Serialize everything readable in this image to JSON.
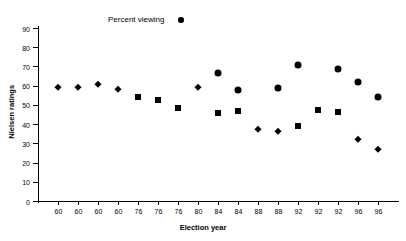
{
  "chart_data": {
    "type": "scatter",
    "title": "",
    "xlabel": "Election year",
    "ylabel": "Nielsen ratings",
    "ylim": [
      0,
      90
    ],
    "y_ticks": [
      0,
      10,
      20,
      30,
      40,
      50,
      60,
      70,
      80,
      90
    ],
    "grid": false,
    "legend": {
      "position": "top-center",
      "entries": [
        {
          "label": "Percent viewing",
          "marker": "circle",
          "color": "#000000"
        }
      ]
    },
    "x_tick_labels": [
      "60",
      "60",
      "60",
      "60",
      "76",
      "76",
      "76",
      "80",
      "84",
      "84",
      "88",
      "88",
      "92",
      "92",
      "92",
      "96",
      "96"
    ],
    "x_positions": [
      1,
      2,
      3,
      4,
      5,
      6,
      7,
      8,
      9,
      10,
      11,
      12,
      13,
      14,
      15,
      16,
      17
    ],
    "points": [
      {
        "x": 1,
        "year": "60",
        "y": 59.5,
        "marker": "diamond"
      },
      {
        "x": 2,
        "year": "60",
        "y": 59.1,
        "marker": "diamond"
      },
      {
        "x": 3,
        "year": "60",
        "y": 61.0,
        "marker": "diamond"
      },
      {
        "x": 4,
        "year": "60",
        "y": 58.1,
        "marker": "diamond"
      },
      {
        "x": 5,
        "year": "76",
        "y": 53.9,
        "marker": "square"
      },
      {
        "x": 6,
        "year": "76",
        "y": 52.8,
        "marker": "square"
      },
      {
        "x": 7,
        "year": "76",
        "y": 48.3,
        "marker": "square"
      },
      {
        "x": 8,
        "year": "80",
        "y": 59.3,
        "marker": "diamond"
      },
      {
        "x": 9,
        "year": "84",
        "y": 66.6,
        "marker": "circle"
      },
      {
        "x": 9,
        "year": "84",
        "y": 46.0,
        "marker": "square"
      },
      {
        "x": 10,
        "year": "84",
        "y": 57.6,
        "marker": "circle"
      },
      {
        "x": 10,
        "year": "84",
        "y": 46.7,
        "marker": "square"
      },
      {
        "x": 11,
        "year": "88",
        "y": 37.5,
        "marker": "diamond"
      },
      {
        "x": 12,
        "year": "88",
        "y": 58.8,
        "marker": "circle"
      },
      {
        "x": 12,
        "year": "88",
        "y": 36.6,
        "marker": "diamond"
      },
      {
        "x": 13,
        "year": "92",
        "y": 70.7,
        "marker": "circle"
      },
      {
        "x": 13,
        "year": "92",
        "y": 39.1,
        "marker": "square"
      },
      {
        "x": 14,
        "year": "92",
        "y": 47.1,
        "marker": "square"
      },
      {
        "x": 15,
        "year": "92",
        "y": 68.8,
        "marker": "circle"
      },
      {
        "x": 15,
        "year": "92",
        "y": 46.1,
        "marker": "square"
      },
      {
        "x": 16,
        "year": "96",
        "y": 61.7,
        "marker": "circle"
      },
      {
        "x": 16,
        "year": "96",
        "y": 32.4,
        "marker": "diamond"
      },
      {
        "x": 17,
        "year": "96",
        "y": 53.9,
        "marker": "circle"
      },
      {
        "x": 17,
        "year": "96",
        "y": 26.8,
        "marker": "diamond"
      }
    ]
  }
}
